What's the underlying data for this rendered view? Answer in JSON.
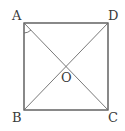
{
  "diagram": {
    "type": "square-with-diagonals",
    "stroke_color": "#4a4a4a",
    "diagonal_color": "#6a6a6a",
    "vertices": {
      "A": {
        "label": "A",
        "x": 24,
        "y": 23
      },
      "D": {
        "label": "D",
        "x": 108,
        "y": 23
      },
      "B": {
        "label": "B",
        "x": 24,
        "y": 110
      },
      "C": {
        "label": "C",
        "x": 108,
        "y": 110
      }
    },
    "center": {
      "label": "O",
      "x": 66,
      "y": 66
    },
    "labels": {
      "A": "A",
      "B": "B",
      "C": "C",
      "D": "D",
      "O": "O"
    },
    "angle_mark": {
      "vertex": "A",
      "between": [
        "AB",
        "AC"
      ]
    }
  }
}
